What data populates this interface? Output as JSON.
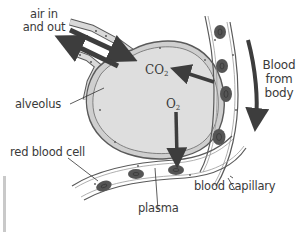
{
  "figure": {
    "type": "labelled-diagram"
  },
  "labels": {
    "air": {
      "line1": "air in",
      "line2": "and out"
    },
    "alveolus": "alveolus",
    "blood_from_body": {
      "line1": "Blood",
      "line2": "from",
      "line3": "body"
    },
    "red_blood_cell": "red blood cell",
    "plasma": "plasma",
    "blood_capillary": "blood capillary",
    "co2": {
      "base": "CO",
      "sub": "2"
    },
    "o2": {
      "base": "O",
      "sub": "2"
    }
  },
  "colors": {
    "alveolus_fill": "#dcdcdc",
    "wall_fill": "#cfcfcf",
    "outline": "#5a5a5a",
    "arrow": "#3d3d3d",
    "rbc_outer": "#555555",
    "rbc_inner": "#7a7a7a",
    "text": "#3a3a3a"
  }
}
